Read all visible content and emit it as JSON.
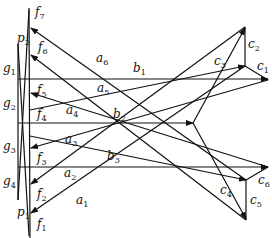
{
  "diagram": {
    "labels": {
      "f7": {
        "base": "f",
        "sub": "7"
      },
      "f6": {
        "base": "f",
        "sub": "6"
      },
      "f5": {
        "base": "f",
        "sub": "5"
      },
      "f4": {
        "base": "f",
        "sub": "4"
      },
      "f3": {
        "base": "f",
        "sub": "3"
      },
      "f2": {
        "base": "f",
        "sub": "2"
      },
      "f1": {
        "base": "f",
        "sub": "1"
      },
      "p2": {
        "base": "p",
        "sub": "2"
      },
      "p1": {
        "base": "p",
        "sub": "1"
      },
      "g1": {
        "base": "g",
        "sub": "1"
      },
      "g2": {
        "base": "g",
        "sub": "2"
      },
      "g3": {
        "base": "g",
        "sub": "3"
      },
      "g4": {
        "base": "g",
        "sub": "4"
      },
      "a6": {
        "base": "a",
        "sub": "6"
      },
      "a5": {
        "base": "a",
        "sub": "5"
      },
      "a4": {
        "base": "a",
        "sub": "4"
      },
      "a3": {
        "base": "a",
        "sub": "3"
      },
      "a2": {
        "base": "a",
        "sub": "2"
      },
      "a1": {
        "base": "a",
        "sub": "1"
      },
      "b1": {
        "base": "b",
        "sub": "1"
      },
      "b2": {
        "base": "b",
        "sub": "2"
      },
      "b3": {
        "base": "b",
        "sub": "3"
      },
      "c1": {
        "base": "c",
        "sub": "1"
      },
      "c2": {
        "base": "c",
        "sub": "2"
      },
      "c3": {
        "base": "c",
        "sub": "3"
      },
      "c4": {
        "base": "c",
        "sub": "4"
      },
      "c5": {
        "base": "c",
        "sub": "5"
      },
      "c6": {
        "base": "c",
        "sub": "6"
      }
    }
  }
}
